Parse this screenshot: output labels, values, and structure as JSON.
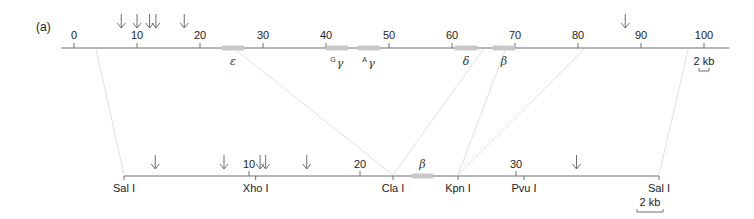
{
  "panel_label": "(a)",
  "colors": {
    "axis": "#6e6e6e",
    "gene_box": "#c8c8c8",
    "connector": "#e2e2e2",
    "arrow": "#6e6e6e",
    "text": "#222222"
  },
  "top_map": {
    "unit": "kb",
    "range": [
      -2,
      104
    ],
    "tick_labels": [
      "0",
      "10",
      "20",
      "30",
      "40",
      "50",
      "60",
      "70",
      "80",
      "90",
      "100"
    ],
    "tick_values": [
      0,
      10,
      20,
      30,
      40,
      50,
      60,
      70,
      80,
      90,
      100
    ],
    "arrows_at": [
      7.5,
      10,
      12,
      13,
      17.5,
      87.5
    ],
    "genes": [
      {
        "name": "epsilon",
        "symbol": "ε",
        "sup": "",
        "start": 23.5,
        "end": 27
      },
      {
        "name": "G-gamma",
        "symbol": "γ",
        "sup": "G",
        "start": 40,
        "end": 43.5
      },
      {
        "name": "A-gamma",
        "symbol": "γ",
        "sup": "A",
        "start": 45,
        "end": 48.5
      },
      {
        "name": "delta",
        "symbol": "δ",
        "sup": "",
        "start": 60.5,
        "end": 64
      },
      {
        "name": "beta",
        "symbol": "β",
        "sup": "",
        "start": 66.5,
        "end": 70
      }
    ],
    "scale_bar": {
      "label": "2 kb",
      "length_kb": 2,
      "at": 100
    }
  },
  "bottom_map": {
    "unit": "kb",
    "sites": [
      {
        "name": "Sal I",
        "pos": 0
      },
      {
        "name": "Xho I",
        "pos": 10.6
      },
      {
        "name": "Cla I",
        "pos": 23
      },
      {
        "name": "Kpn I",
        "pos": 28.2
      },
      {
        "name": "Pvu I",
        "pos": 31
      },
      {
        "name": "Sal I",
        "pos": 40
      }
    ],
    "tick_labels": [
      "10",
      "20",
      "30"
    ],
    "tick_values": [
      10,
      20,
      30
    ],
    "arrows_at": [
      2.5,
      8,
      11,
      11.5,
      15.2,
      34.5
    ],
    "genes": [
      {
        "name": "beta",
        "symbol": "β",
        "start": 24.5,
        "end": 26.2
      }
    ],
    "scale_bar": {
      "label": "2 kb",
      "length_kb": 2
    }
  },
  "connections": [
    {
      "top": 3.5,
      "bottom": 0
    },
    {
      "top": 25.5,
      "bottom": 23
    },
    {
      "top": 65,
      "bottom": 23
    },
    {
      "top": 68.5,
      "bottom": 28.2
    },
    {
      "top": 81,
      "bottom": 28.2
    },
    {
      "top": 97.5,
      "bottom": 40
    }
  ]
}
